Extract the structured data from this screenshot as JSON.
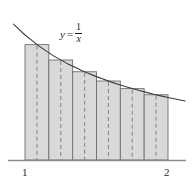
{
  "figure": {
    "curve_label": {
      "lhs": "y",
      "equals": "=",
      "numerator": "1",
      "denominator": "x"
    },
    "axis": {
      "ticks": [
        {
          "label": "1",
          "value": 1
        },
        {
          "label": "2",
          "value": 2
        }
      ]
    },
    "colors": {
      "bar_fill": "#d9d9d9",
      "bar_stroke": "#6e6e6e",
      "curve_stroke": "#3a3a3a",
      "axis_stroke": "#8a8a8a",
      "dash_stroke": "#8a8a8a",
      "text": "#2b2b2b"
    }
  },
  "chart_data": {
    "type": "bar",
    "title": "",
    "xlabel": "",
    "ylabel": "",
    "function": "y = 1/x",
    "method": "midpoint",
    "n": 6,
    "xlim": [
      1,
      2
    ],
    "ylim": [
      0,
      1.0
    ],
    "grid": false,
    "legend": null,
    "categories": [
      "[1.000, 1.167]",
      "[1.167, 1.333]",
      "[1.333, 1.500]",
      "[1.500, 1.667]",
      "[1.667, 1.833]",
      "[1.833, 2.000]"
    ],
    "edges": [
      1.0,
      1.16667,
      1.33333,
      1.5,
      1.66667,
      1.83333,
      2.0
    ],
    "midpoints": [
      1.08333,
      1.25,
      1.41667,
      1.58333,
      1.75,
      1.91667
    ],
    "values": [
      0.923,
      0.8,
      0.706,
      0.632,
      0.571,
      0.522
    ],
    "curve": {
      "x": [
        0.92,
        1.0,
        1.1,
        1.2,
        1.3,
        1.4,
        1.5,
        1.6,
        1.7,
        1.8,
        1.9,
        2.0,
        2.12
      ],
      "y": [
        1.087,
        1.0,
        0.909,
        0.833,
        0.769,
        0.714,
        0.667,
        0.625,
        0.588,
        0.556,
        0.526,
        0.5,
        0.472
      ]
    },
    "annotations": [
      {
        "text": "y = 1/x",
        "x": 1.24,
        "y": 0.95
      }
    ]
  }
}
